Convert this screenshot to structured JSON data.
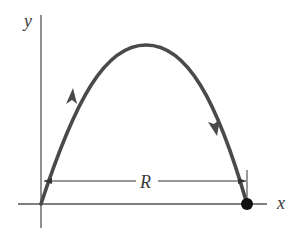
{
  "diagram": {
    "axes": {
      "x_label": "x",
      "y_label": "y"
    },
    "range_label": "R",
    "colors": {
      "trajectory": "#4a4a4a",
      "axes": "#555555",
      "landing_point": "#111111",
      "text": "#3a3a3a"
    },
    "elements": [
      "y-axis",
      "x-axis",
      "parabolic trajectory",
      "upward direction arrow",
      "downward direction arrow",
      "range dimension line R",
      "landing point"
    ]
  }
}
